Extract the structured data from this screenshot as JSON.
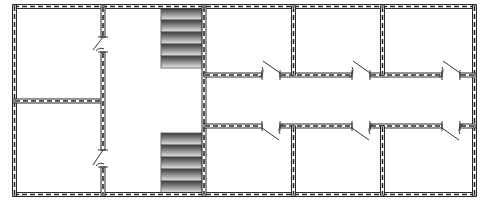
{
  "diagram": {
    "type": "floor-plan",
    "width": 482,
    "height": 206,
    "colors": {
      "wall_stroke": "#2a2a2a",
      "wall_dash": "#2a2a2a",
      "background": "#ffffff",
      "stair_dark": "#3a3a3a",
      "stair_light": "#e8e8e8"
    },
    "walls": [
      {
        "id": "outer-top",
        "x1": 13,
        "y1": 6.5,
        "x2": 476,
        "y2": 6.5,
        "o": "h"
      },
      {
        "id": "outer-bottom",
        "x1": 13,
        "y1": 194.5,
        "x2": 476,
        "y2": 194.5,
        "o": "h"
      },
      {
        "id": "outer-left",
        "x1": 14.5,
        "y1": 5,
        "x2": 14.5,
        "y2": 196,
        "o": "v"
      },
      {
        "id": "outer-right",
        "x1": 474.5,
        "y1": 5,
        "x2": 474.5,
        "y2": 196,
        "o": "v"
      },
      {
        "id": "left-mid",
        "x1": 14,
        "y1": 101,
        "x2": 104,
        "y2": 101,
        "o": "h"
      },
      {
        "id": "left-vert-a",
        "x1": 103,
        "y1": 6,
        "x2": 103,
        "y2": 37,
        "o": "v"
      },
      {
        "id": "left-vert-b",
        "x1": 103,
        "y1": 52,
        "x2": 103,
        "y2": 150,
        "o": "v"
      },
      {
        "id": "left-vert-c",
        "x1": 103,
        "y1": 167,
        "x2": 103,
        "y2": 195,
        "o": "v"
      },
      {
        "id": "stair-wall",
        "x1": 204,
        "y1": 6,
        "x2": 204,
        "y2": 195,
        "o": "v"
      },
      {
        "id": "corr-top-1",
        "x1": 204,
        "y1": 75,
        "x2": 262,
        "y2": 75,
        "o": "h"
      },
      {
        "id": "corr-top-2",
        "x1": 280,
        "y1": 75,
        "x2": 352,
        "y2": 75,
        "o": "h"
      },
      {
        "id": "corr-top-3",
        "x1": 370,
        "y1": 75,
        "x2": 442,
        "y2": 75,
        "o": "h"
      },
      {
        "id": "corr-top-4",
        "x1": 460,
        "y1": 75,
        "x2": 475,
        "y2": 75,
        "o": "h"
      },
      {
        "id": "corr-bot-1",
        "x1": 204,
        "y1": 126,
        "x2": 262,
        "y2": 126,
        "o": "h"
      },
      {
        "id": "corr-bot-2",
        "x1": 280,
        "y1": 126,
        "x2": 352,
        "y2": 126,
        "o": "h"
      },
      {
        "id": "corr-bot-3",
        "x1": 370,
        "y1": 126,
        "x2": 442,
        "y2": 126,
        "o": "h"
      },
      {
        "id": "corr-bot-4",
        "x1": 460,
        "y1": 126,
        "x2": 475,
        "y2": 126,
        "o": "h"
      },
      {
        "id": "room-div-top-1",
        "x1": 293.5,
        "y1": 6,
        "x2": 293.5,
        "y2": 75,
        "o": "v"
      },
      {
        "id": "room-div-top-2",
        "x1": 382.5,
        "y1": 6,
        "x2": 382.5,
        "y2": 75,
        "o": "v"
      },
      {
        "id": "room-div-bot-1",
        "x1": 293.5,
        "y1": 126,
        "x2": 293.5,
        "y2": 195,
        "o": "v"
      },
      {
        "id": "room-div-bot-2",
        "x1": 382.5,
        "y1": 126,
        "x2": 382.5,
        "y2": 195,
        "o": "v"
      }
    ],
    "doors": [
      {
        "id": "door-left-upper",
        "orientation": "v",
        "x": 103,
        "y1": 37,
        "y2": 52,
        "swing": "left-down"
      },
      {
        "id": "door-left-lower",
        "orientation": "v",
        "x": 103,
        "y1": 150,
        "y2": 167,
        "swing": "left-down"
      },
      {
        "id": "door-top-1",
        "orientation": "h",
        "y": 75,
        "x1": 262,
        "x2": 280,
        "swing": "up"
      },
      {
        "id": "door-top-2",
        "orientation": "h",
        "y": 75,
        "x1": 352,
        "x2": 370,
        "swing": "up"
      },
      {
        "id": "door-top-3",
        "orientation": "h",
        "y": 75,
        "x1": 442,
        "x2": 460,
        "swing": "up"
      },
      {
        "id": "door-bot-1",
        "orientation": "h",
        "y": 126,
        "x1": 262,
        "x2": 280,
        "swing": "down"
      },
      {
        "id": "door-bot-2",
        "orientation": "h",
        "y": 126,
        "x1": 352,
        "x2": 370,
        "swing": "down"
      },
      {
        "id": "door-bot-3",
        "orientation": "h",
        "y": 126,
        "x1": 442,
        "x2": 460,
        "swing": "down"
      }
    ],
    "stairs": [
      {
        "id": "stairs-top",
        "x": 161,
        "y": 8,
        "width": 41,
        "height": 60,
        "steps": 5
      },
      {
        "id": "stairs-bottom",
        "x": 161,
        "y": 133,
        "width": 41,
        "height": 60,
        "steps": 5
      }
    ],
    "rooms": [
      {
        "id": "room-left-upper"
      },
      {
        "id": "room-left-lower"
      },
      {
        "id": "hall-center"
      },
      {
        "id": "room-top-1"
      },
      {
        "id": "room-top-2"
      },
      {
        "id": "room-top-3"
      },
      {
        "id": "corridor"
      },
      {
        "id": "room-bottom-1"
      },
      {
        "id": "room-bottom-2"
      },
      {
        "id": "room-bottom-3"
      }
    ]
  }
}
